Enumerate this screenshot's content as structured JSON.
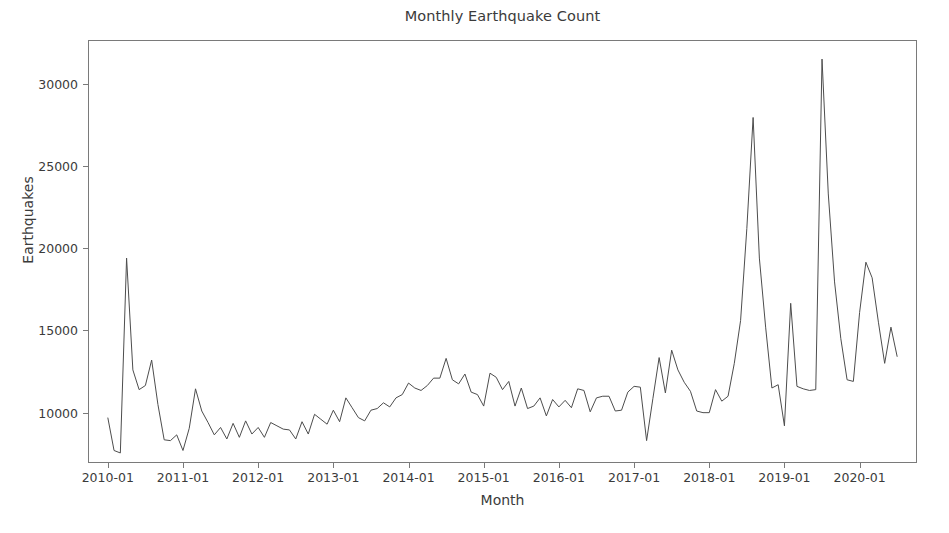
{
  "chart_data": {
    "type": "line",
    "title": "Monthly Earthquake Count",
    "xlabel": "Month",
    "ylabel": "Earthquakes",
    "grid": false,
    "legend": null,
    "line_color": "#4d4d4d",
    "ylim": [
      7000,
      32600
    ],
    "xlim": [
      "2009-10",
      "2020-10"
    ],
    "ytick_values": [
      10000,
      15000,
      20000,
      25000,
      30000
    ],
    "ytick_labels": [
      "10000",
      "15000",
      "20000",
      "25000",
      "30000"
    ],
    "xtick_labels": [
      "2010-01",
      "2011-01",
      "2012-01",
      "2013-01",
      "2014-01",
      "2015-01",
      "2016-01",
      "2017-01",
      "2018-01",
      "2019-01",
      "2020-01"
    ],
    "x": [
      "2010-01",
      "2010-02",
      "2010-03",
      "2010-04",
      "2010-05",
      "2010-06",
      "2010-07",
      "2010-08",
      "2010-09",
      "2010-10",
      "2010-11",
      "2010-12",
      "2011-01",
      "2011-02",
      "2011-03",
      "2011-04",
      "2011-05",
      "2011-06",
      "2011-07",
      "2011-08",
      "2011-09",
      "2011-10",
      "2011-11",
      "2011-12",
      "2012-01",
      "2012-02",
      "2012-03",
      "2012-04",
      "2012-05",
      "2012-06",
      "2012-07",
      "2012-08",
      "2012-09",
      "2012-10",
      "2012-11",
      "2012-12",
      "2013-01",
      "2013-02",
      "2013-03",
      "2013-04",
      "2013-05",
      "2013-06",
      "2013-07",
      "2013-08",
      "2013-09",
      "2013-10",
      "2013-11",
      "2013-12",
      "2014-01",
      "2014-02",
      "2014-03",
      "2014-04",
      "2014-05",
      "2014-06",
      "2014-07",
      "2014-08",
      "2014-09",
      "2014-10",
      "2014-11",
      "2014-12",
      "2015-01",
      "2015-02",
      "2015-03",
      "2015-04",
      "2015-05",
      "2015-06",
      "2015-07",
      "2015-08",
      "2015-09",
      "2015-10",
      "2015-11",
      "2015-12",
      "2016-01",
      "2016-02",
      "2016-03",
      "2016-04",
      "2016-05",
      "2016-06",
      "2016-07",
      "2016-08",
      "2016-09",
      "2016-10",
      "2016-11",
      "2016-12",
      "2017-01",
      "2017-02",
      "2017-03",
      "2017-04",
      "2017-05",
      "2017-06",
      "2017-07",
      "2017-08",
      "2017-09",
      "2017-10",
      "2017-11",
      "2017-12",
      "2018-01",
      "2018-02",
      "2018-03",
      "2018-04",
      "2018-05",
      "2018-06",
      "2018-07",
      "2018-08",
      "2018-09",
      "2018-10",
      "2018-11",
      "2018-12",
      "2019-01",
      "2019-02",
      "2019-03",
      "2019-04",
      "2019-05",
      "2019-06",
      "2019-07",
      "2019-08",
      "2019-09",
      "2019-10",
      "2019-11",
      "2019-12",
      "2020-01",
      "2020-02",
      "2020-03",
      "2020-04",
      "2020-05",
      "2020-06",
      "2020-07"
    ],
    "values": [
      9700,
      7700,
      7550,
      19400,
      12600,
      11400,
      11650,
      13200,
      10500,
      8350,
      8300,
      8650,
      7700,
      9050,
      11450,
      10100,
      9400,
      8650,
      9100,
      8400,
      9350,
      8500,
      9500,
      8700,
      9100,
      8500,
      9400,
      9200,
      9000,
      8950,
      8400,
      9450,
      8700,
      9900,
      9600,
      9300,
      10150,
      9450,
      10900,
      10300,
      9700,
      9500,
      10150,
      10250,
      10600,
      10350,
      10900,
      11100,
      11800,
      11500,
      11350,
      11650,
      12100,
      12100,
      13300,
      12000,
      11750,
      12350,
      11250,
      11100,
      10400,
      12400,
      12150,
      11400,
      11900,
      10400,
      11500,
      10250,
      10400,
      10900,
      9800,
      10800,
      10350,
      10750,
      10300,
      11450,
      11350,
      10050,
      10900,
      11000,
      11000,
      10100,
      10150,
      11250,
      11600,
      11550,
      8300,
      10850,
      13350,
      11200,
      13800,
      12600,
      11850,
      11300,
      10100,
      10000,
      10000,
      11400,
      10700,
      11000,
      13000,
      15600,
      21200,
      27950,
      19400,
      15200,
      11500,
      11700,
      9200,
      16650,
      11600,
      11450,
      11350,
      11400,
      31500,
      23300,
      17950,
      14500,
      12000,
      11900,
      16100,
      19150,
      18200,
      15500,
      13000,
      15200,
      13400
    ]
  }
}
